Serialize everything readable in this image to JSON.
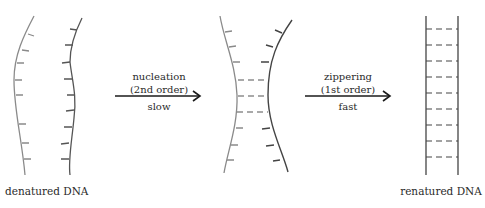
{
  "stages": [
    {
      "id": "denatured",
      "label": "denatured DNA"
    },
    {
      "id": "nucleated",
      "label": ""
    },
    {
      "id": "renatured",
      "label": "renatured DNA"
    }
  ],
  "arrows": [
    {
      "id": "nucleation",
      "top_line1": "nucleation",
      "top_line2": "(2nd order)",
      "bottom": "slow"
    },
    {
      "id": "zippering",
      "top_line1": "zippering",
      "top_line2": "(1st order)",
      "bottom": "fast"
    }
  ],
  "colors": {
    "strand_light": "#8a8a8a",
    "strand_dark": "#444444",
    "arrow": "#1a1a1a",
    "bond": "#555555",
    "background": "#ffffff"
  },
  "counts": {
    "nucleation_bonds": 3,
    "renatured_rungs": 9
  }
}
